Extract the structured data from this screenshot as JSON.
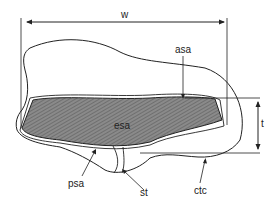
{
  "diagram": {
    "type": "cross-section schematic",
    "labels": {
      "width": "w",
      "thickness": "t",
      "anterior": "asa",
      "center": "esa",
      "posterior": "psa",
      "stalk": "st",
      "outer": "ctc"
    },
    "colors": {
      "line": "#222222",
      "fill": "#7a7a7a",
      "background": "#ffffff"
    }
  }
}
